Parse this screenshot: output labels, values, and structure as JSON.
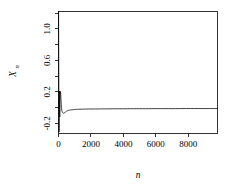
{
  "chart_data": {
    "type": "line",
    "title": "",
    "subtitle": "",
    "xlabel": "n",
    "ylabel": "X",
    "ylabel_subscript": "n",
    "xlim": [
      0,
      9800
    ],
    "ylim": [
      -0.33,
      1.22
    ],
    "xticks": [
      0,
      2000,
      4000,
      6000,
      8000
    ],
    "xticklabels": [
      "0",
      "2000",
      "4000",
      "6000",
      "8000"
    ],
    "yticks": [
      -0.2,
      0.2,
      0.6,
      1.0
    ],
    "yticklabels": [
      "-0.2",
      "0.2",
      "0.6",
      "1.0"
    ],
    "yminorticks": [
      -0.2,
      0.0,
      0.2,
      0.4,
      0.6,
      0.8,
      1.0,
      1.2
    ],
    "grid": false,
    "legend": null,
    "line_color": "#000000",
    "background_color": "#ffffff",
    "frame": "box",
    "series": [
      {
        "name": "X_n",
        "x": [
          5,
          12,
          18,
          24,
          30,
          36,
          42,
          48,
          54,
          60,
          66,
          72,
          78,
          84,
          90,
          96,
          102,
          110,
          120,
          130,
          140,
          150,
          160,
          170,
          180,
          190,
          200,
          215,
          230,
          245,
          260,
          275,
          290,
          305,
          320,
          340,
          360,
          380,
          400,
          420,
          440,
          460,
          480,
          500,
          530,
          560,
          590,
          620,
          650,
          680,
          710,
          740,
          780,
          820,
          860,
          900,
          950,
          1000,
          1060,
          1120,
          1180,
          1250,
          1320,
          1400,
          1480,
          1560,
          1650,
          1750,
          1850,
          1950,
          2060,
          2170,
          2280,
          2400,
          2520,
          2640,
          2770,
          2900,
          3040,
          3180,
          3320,
          3470,
          3620,
          3780,
          3940,
          4100,
          4270,
          4440,
          4620,
          4800,
          4980,
          5170,
          5360,
          5550,
          5750,
          5950,
          6150,
          6360,
          6570,
          6780,
          7000,
          7220,
          7440,
          7670,
          7900,
          8130,
          8370,
          8610,
          8850,
          9100,
          9350,
          9600,
          9780
        ],
        "y": [
          1.22,
          0.74,
          0.4,
          0.08,
          -0.26,
          -0.31,
          -0.14,
          0.09,
          0.21,
          0.16,
          0.04,
          -0.08,
          -0.12,
          -0.05,
          0.05,
          0.12,
          0.15,
          0.18,
          0.205,
          0.19,
          0.16,
          0.12,
          0.075,
          0.035,
          0.005,
          -0.015,
          -0.03,
          -0.048,
          -0.058,
          -0.063,
          -0.066,
          -0.068,
          -0.07,
          -0.072,
          -0.073,
          -0.072,
          -0.069,
          -0.065,
          -0.061,
          -0.057,
          -0.054,
          -0.051,
          -0.048,
          -0.046,
          -0.043,
          -0.04,
          -0.038,
          -0.036,
          -0.034,
          -0.033,
          -0.032,
          -0.031,
          -0.03,
          -0.029,
          -0.028,
          -0.027,
          -0.026,
          -0.025,
          -0.024,
          -0.023,
          -0.023,
          -0.022,
          -0.022,
          -0.021,
          -0.021,
          -0.02,
          -0.02,
          -0.02,
          -0.019,
          -0.019,
          -0.019,
          -0.018,
          -0.018,
          -0.018,
          -0.018,
          -0.017,
          -0.017,
          -0.017,
          -0.017,
          -0.017,
          -0.016,
          -0.016,
          -0.016,
          -0.016,
          -0.016,
          -0.016,
          -0.015,
          -0.015,
          -0.015,
          -0.015,
          -0.015,
          -0.015,
          -0.015,
          -0.015,
          -0.014,
          -0.014,
          -0.014,
          -0.014,
          -0.014,
          -0.014,
          -0.014,
          -0.014,
          -0.014,
          -0.013,
          -0.013,
          -0.013,
          -0.013,
          -0.013,
          -0.013,
          -0.013,
          -0.013,
          -0.013,
          -0.013
        ]
      }
    ]
  }
}
